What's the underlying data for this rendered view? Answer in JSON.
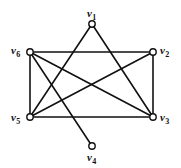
{
  "figure": {
    "type": "undirected-graph-drawing",
    "background_color": "#ffffff",
    "stroke_color": "#111111",
    "vertex_fill_color": "#ffffff",
    "canvas": {
      "width": 181,
      "height": 168
    }
  },
  "vertices": [
    {
      "id": "v1",
      "label": "v",
      "subscript": "1",
      "cx": 92,
      "cy": 24,
      "r": 3.2,
      "label_x": 87,
      "label_y": 8,
      "label_anchor": "top-center"
    },
    {
      "id": "v2",
      "label": "v",
      "subscript": "2",
      "cx": 153,
      "cy": 52,
      "r": 3.2,
      "label_x": 160,
      "label_y": 45,
      "label_anchor": "right"
    },
    {
      "id": "v3",
      "label": "v",
      "subscript": "3",
      "cx": 153,
      "cy": 117,
      "r": 3.2,
      "label_x": 160,
      "label_y": 112,
      "label_anchor": "right"
    },
    {
      "id": "v4",
      "label": "v",
      "subscript": "4",
      "cx": 92,
      "cy": 146,
      "r": 3.2,
      "label_x": 87,
      "label_y": 152,
      "label_anchor": "bottom-center"
    },
    {
      "id": "v5",
      "label": "v",
      "subscript": "5",
      "cx": 30,
      "cy": 117,
      "r": 3.2,
      "label_x": 11,
      "label_y": 112,
      "label_anchor": "left"
    },
    {
      "id": "v6",
      "label": "v",
      "subscript": "6",
      "cx": 30,
      "cy": 52,
      "r": 3.2,
      "label_x": 11,
      "label_y": 45,
      "label_anchor": "left"
    }
  ],
  "edges": [
    {
      "from": "v6",
      "to": "v2",
      "description": "top-horizontal"
    },
    {
      "from": "v6",
      "to": "v5",
      "description": "left-vertical"
    },
    {
      "from": "v5",
      "to": "v3",
      "description": "bottom-horizontal"
    },
    {
      "from": "v2",
      "to": "v3",
      "description": "right-vertical"
    },
    {
      "from": "v6",
      "to": "v3",
      "description": "diagonal-down-right"
    },
    {
      "from": "v5",
      "to": "v2",
      "description": "diagonal-up-right"
    },
    {
      "from": "v6",
      "to": "v4",
      "description": "diagonal-down-right-steep"
    },
    {
      "from": "v1",
      "to": "v3",
      "description": "diagonal-down-right"
    },
    {
      "from": "v1",
      "to": "v5",
      "description": "vertical-down"
    }
  ],
  "edge_count": 9,
  "vertex_count": 6
}
